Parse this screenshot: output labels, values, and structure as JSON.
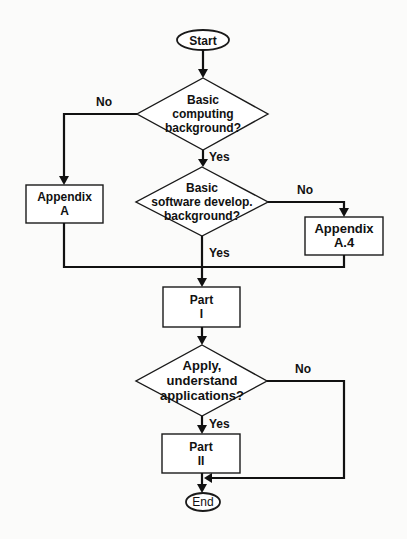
{
  "diagram": {
    "type": "flowchart",
    "nodes": {
      "start": {
        "kind": "terminal",
        "lines": [
          "Start"
        ]
      },
      "q_computing": {
        "kind": "decision",
        "lines": [
          "Basic",
          "computing",
          "background?"
        ]
      },
      "appendix_a": {
        "kind": "process",
        "lines": [
          "Appendix",
          "A"
        ]
      },
      "q_software": {
        "kind": "decision",
        "lines": [
          "Basic",
          "software develop.",
          "background?"
        ]
      },
      "appendix_a4": {
        "kind": "process",
        "lines": [
          "Appendix",
          "A.4"
        ]
      },
      "part_1": {
        "kind": "process",
        "lines": [
          "Part",
          "I"
        ]
      },
      "q_apply": {
        "kind": "decision",
        "lines": [
          "Apply,",
          "understand",
          "applications?"
        ]
      },
      "part_2": {
        "kind": "process",
        "lines": [
          "Part",
          "II"
        ]
      },
      "end": {
        "kind": "terminal",
        "lines": [
          "End"
        ]
      }
    },
    "edge_labels": {
      "computing_no": "No",
      "computing_yes": "Yes",
      "software_no": "No",
      "software_yes": "Yes",
      "apply_no": "No",
      "apply_yes": "Yes"
    },
    "edges": [
      {
        "from": "start",
        "to": "q_computing",
        "label": ""
      },
      {
        "from": "q_computing",
        "to": "appendix_a",
        "label": "No"
      },
      {
        "from": "q_computing",
        "to": "q_software",
        "label": "Yes"
      },
      {
        "from": "q_software",
        "to": "appendix_a4",
        "label": "No"
      },
      {
        "from": "q_software",
        "to": "part_1",
        "label": "Yes"
      },
      {
        "from": "appendix_a",
        "to": "part_1",
        "label": ""
      },
      {
        "from": "appendix_a4",
        "to": "part_1",
        "label": ""
      },
      {
        "from": "part_1",
        "to": "q_apply",
        "label": ""
      },
      {
        "from": "q_apply",
        "to": "part_2",
        "label": "Yes"
      },
      {
        "from": "q_apply",
        "to": "end",
        "label": "No"
      },
      {
        "from": "part_2",
        "to": "end",
        "label": ""
      }
    ]
  }
}
